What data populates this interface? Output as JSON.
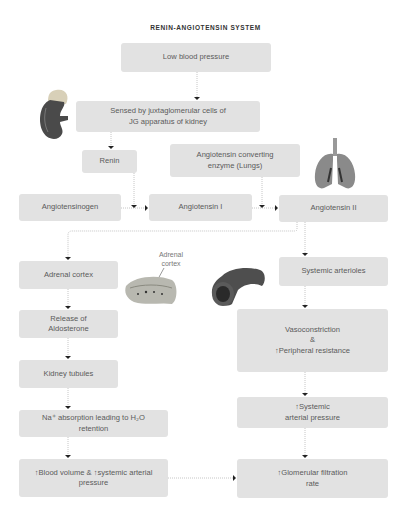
{
  "title": "RENIN-ANGIOTENSIN SYSTEM",
  "nodes": {
    "low_bp": "Low blood pressure",
    "sensed": "Sensed by juxtaglomerular cells of\nJG apparatus of kidney",
    "renin": "Renin",
    "ace": "Angiotensin converting\nenzyme (Lungs)",
    "angiotensinogen": "Angiotensinogen",
    "angiotensin1": "Angiotensin I",
    "angiotensin2": "Angiotensin II",
    "adrenal_cortex": "Adrenal cortex",
    "aldosterone": "Release of\nAldosterone",
    "kidney_tubules": "Kidney tubules",
    "na_absorption": "Na⁺ absorption leading to H₂O\nretention",
    "blood_volume": "↑Blood volume &  ↑systemic arterial\npressure",
    "systemic_arterioles": "Systemic arterioles",
    "vasoconstriction": "Vasoconstriction\n&\n↑Peripheral resistance",
    "systemic_pressure": "↑Systemic\narterial pressure",
    "gfr": "↑Glomerular filtration\nrate"
  },
  "illustrations": {
    "adrenal_label": "Adrenal\ncortex",
    "kidney": "kidney-illustration",
    "lungs": "lungs-illustration",
    "adrenal": "adrenal-gland-illustration",
    "artery": "arteriole-illustration"
  },
  "colors": {
    "box_fill": "#e2e2e2",
    "text": "#5a5a5a",
    "connector": "#b0b0b0",
    "arrowhead": "#222222"
  }
}
